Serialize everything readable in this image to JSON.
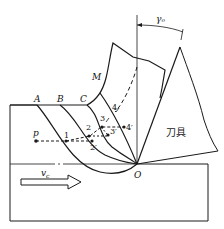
{
  "diagram": {
    "type": "metal-cutting-chip-formation",
    "labels": {
      "A": "A",
      "B": "B",
      "C": "C",
      "M": "M",
      "O": "O",
      "P": "p",
      "rake_angle": "γₒ",
      "tool": "刀具",
      "velocity": "v",
      "velocity_sub": "c"
    },
    "points": {
      "p1": "1",
      "p2": "2",
      "p2p": "2′",
      "p3": "3",
      "p3p": "3′",
      "p4": "4",
      "p4p": "4′"
    },
    "colors": {
      "stroke": "#1a1a1a",
      "background": "#ffffff"
    }
  }
}
